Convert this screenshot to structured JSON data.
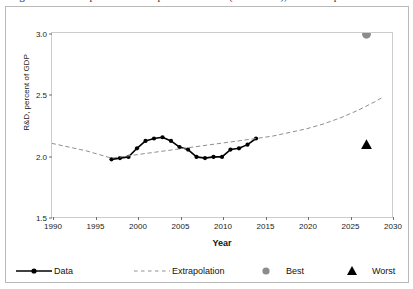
{
  "figure": {
    "title": "Figure 3. R&D expenditures as a percent of GDP (1997-2014), with extrapolation to 2027",
    "background_color": "#ffffff",
    "border_color": "#b9b9b9"
  },
  "axes": {
    "xlabel": "Year",
    "ylabel": "R&D, percent of GDP",
    "x_ticks": [
      1990,
      1995,
      2000,
      2005,
      2010,
      2015,
      2020,
      2025,
      2030
    ],
    "y_ticks": [
      "1.5",
      "2.0",
      "2.5",
      "3.0"
    ],
    "xlim": [
      1990,
      2030
    ],
    "ylim": [
      1.5,
      3.0
    ],
    "grid": false,
    "frame_color": "#cccccc",
    "tick_color": "#6f6f6f"
  },
  "legend": {
    "position": "below-axes",
    "entries": [
      {
        "label": "Data",
        "marker": "circle-line",
        "color": "#000000"
      },
      {
        "label": "Extrapolation",
        "marker": "dashed-line",
        "color": "#909090"
      },
      {
        "label": "Best",
        "marker": "circle",
        "color": "#8c8c8c"
      },
      {
        "label": "Worst",
        "marker": "triangle",
        "color": "#000000"
      }
    ]
  },
  "chart_data": {
    "type": "line",
    "title": "Figure 3. R&D expenditures as a percent of GDP (1997-2014), with extrapolation to 2027",
    "xlabel": "Year",
    "ylabel": "R&D, percent of GDP",
    "xlim": [
      1990,
      2030
    ],
    "ylim": [
      1.5,
      3.0
    ],
    "grid": false,
    "series": [
      {
        "name": "Data",
        "type": "line",
        "style": "solid",
        "marker": "circle",
        "color": "#000000",
        "x": [
          1997,
          1998,
          1999,
          2000,
          2001,
          2002,
          2003,
          2004,
          2005,
          2006,
          2007,
          2008,
          2009,
          2010,
          2011,
          2012,
          2013,
          2014
        ],
        "y": [
          1.97,
          1.98,
          1.99,
          2.06,
          2.12,
          2.14,
          2.15,
          2.12,
          2.07,
          2.05,
          1.99,
          1.98,
          1.99,
          1.99,
          2.05,
          2.06,
          2.09,
          2.14
        ]
      },
      {
        "name": "Extrapolation",
        "type": "line",
        "style": "dashed",
        "marker": "none",
        "color": "#909090",
        "x": [
          1990,
          1992,
          1994,
          1996,
          1997,
          2014,
          2016,
          2018,
          2020,
          2022,
          2024,
          2026,
          2028,
          2029
        ],
        "y": [
          2.1,
          2.07,
          2.04,
          2.0,
          1.98,
          2.14,
          2.16,
          2.19,
          2.22,
          2.26,
          2.31,
          2.37,
          2.44,
          2.48
        ]
      },
      {
        "name": "Best",
        "type": "scatter",
        "marker": "circle",
        "color": "#8c8c8c",
        "x": [
          2027
        ],
        "y": [
          2.99
        ]
      },
      {
        "name": "Worst",
        "type": "scatter",
        "marker": "triangle",
        "color": "#000000",
        "x": [
          2027
        ],
        "y": [
          2.09
        ]
      }
    ]
  }
}
